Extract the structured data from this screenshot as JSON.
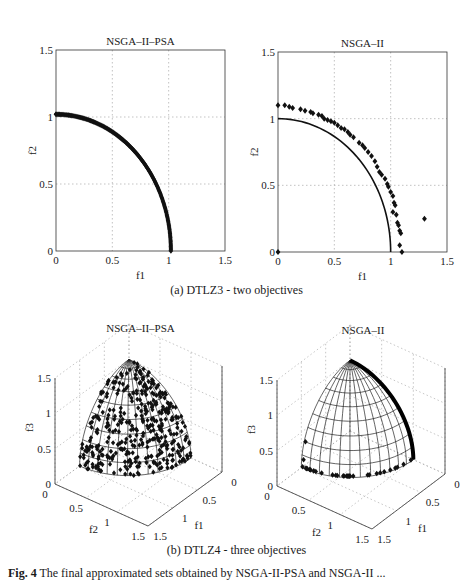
{
  "figure": {
    "subcaption_a": "(a) DTLZ3 - two objectives",
    "subcaption_b": "(b) DTLZ4 - three objectives",
    "caption_bold": "Fig. 4",
    "caption_text": " The final approximated sets obtained by NSGA-II-PSA and NSGA-II ..."
  },
  "chart_data": [
    {
      "id": "a1",
      "type": "scatter",
      "title": "NSGA–II–PSA",
      "xlabel": "f1",
      "ylabel": "f2",
      "xlim": [
        0,
        1.5
      ],
      "ylim": [
        0,
        1.5
      ],
      "xticks": [
        "0",
        "0.5",
        "1",
        "1.5"
      ],
      "yticks": [
        "0",
        "0.5",
        "1",
        "1.5"
      ],
      "grid": true,
      "box": {
        "left": 56,
        "top": 50,
        "right": 225,
        "bottom": 251
      },
      "reference_front": "none",
      "series": [
        {
          "name": "NSGA-II-PSA",
          "description": "dense points along quarter circle radius ~1.02, f1 in [0,1.02]",
          "radius": 1.02,
          "count": 160
        }
      ]
    },
    {
      "id": "a2",
      "type": "scatter",
      "title": "NSGA–II",
      "xlabel": "f1",
      "ylabel": "f2",
      "xlim": [
        0,
        1.5
      ],
      "ylim": [
        0,
        1.5
      ],
      "xticks": [
        "0",
        "0.5",
        "1",
        "1.5"
      ],
      "yticks": [
        "0",
        "0.5",
        "1",
        "1.5"
      ],
      "grid": true,
      "box": {
        "left": 278,
        "top": 52,
        "right": 447,
        "bottom": 252
      },
      "reference_front": "quarter circle radius 1",
      "series": [
        {
          "name": "NSGA-II",
          "points": [
            [
              0.0,
              1.1
            ],
            [
              0.06,
              1.1
            ],
            [
              0.1,
              1.09
            ],
            [
              0.13,
              1.08
            ],
            [
              0.2,
              1.07
            ],
            [
              0.24,
              1.06
            ],
            [
              0.29,
              1.05
            ],
            [
              0.31,
              1.04
            ],
            [
              0.36,
              1.03
            ],
            [
              0.39,
              1.02
            ],
            [
              0.41,
              1.0
            ],
            [
              0.44,
              0.99
            ],
            [
              0.47,
              0.98
            ],
            [
              0.5,
              0.97
            ],
            [
              0.53,
              0.95
            ],
            [
              0.56,
              0.93
            ],
            [
              0.59,
              0.92
            ],
            [
              0.62,
              0.9
            ],
            [
              0.64,
              0.88
            ],
            [
              0.67,
              0.86
            ],
            [
              0.72,
              0.82
            ],
            [
              0.75,
              0.8
            ],
            [
              0.77,
              0.78
            ],
            [
              0.8,
              0.75
            ],
            [
              0.83,
              0.72
            ],
            [
              0.86,
              0.68
            ],
            [
              0.88,
              0.64
            ],
            [
              0.9,
              0.6
            ],
            [
              0.92,
              0.58
            ],
            [
              0.95,
              0.55
            ],
            [
              0.97,
              0.51
            ],
            [
              0.98,
              0.49
            ],
            [
              1.0,
              0.45
            ],
            [
              1.02,
              0.42
            ],
            [
              1.03,
              0.37
            ],
            [
              1.04,
              0.35
            ],
            [
              1.02,
              0.3
            ],
            [
              1.05,
              0.28
            ],
            [
              1.06,
              0.22
            ],
            [
              1.07,
              0.2
            ],
            [
              1.08,
              0.16
            ],
            [
              1.09,
              0.14
            ],
            [
              1.08,
              0.05
            ],
            [
              1.1,
              0.0
            ],
            [
              0.0,
              0.0
            ],
            [
              1.3,
              0.25
            ]
          ]
        }
      ]
    },
    {
      "id": "b1",
      "type": "scatter3d",
      "title": "NSGA–II–PSA",
      "xlabel": "f1",
      "ylabel": "f2",
      "zlabel": "f3",
      "xlim": [
        0,
        1.5
      ],
      "ylim": [
        0,
        1.5
      ],
      "zlim": [
        0,
        1.5
      ],
      "xticks": [
        "0",
        "0.5",
        "1",
        "1.5"
      ],
      "yticks": [
        "0",
        "0.5",
        "1",
        "1.5"
      ],
      "zticks": [
        "0",
        "0.5",
        "1",
        "1.5"
      ],
      "frame": {
        "origin": [
          55,
          484
        ],
        "f2_end": [
          148,
          526
        ],
        "f1_end": [
          222,
          472
        ],
        "z_top": 378
      },
      "reference_front": "unit sphere octant (mesh)",
      "series": [
        {
          "name": "NSGA-II-PSA",
          "description": "~400 points spread over the spherical front",
          "count": 380
        }
      ]
    },
    {
      "id": "b2",
      "type": "scatter3d",
      "title": "NSGA–II",
      "xlabel": "f1",
      "ylabel": "f2",
      "zlabel": "f3",
      "xlim": [
        0,
        1.5
      ],
      "ylim": [
        0,
        1.5
      ],
      "zlim": [
        0,
        1.5
      ],
      "xticks": [
        "0",
        "0.5",
        "1",
        "1.5"
      ],
      "yticks": [
        "0",
        "0.5",
        "1",
        "1.5"
      ],
      "zticks": [
        "0",
        "0.5",
        "1",
        "1.5"
      ],
      "frame": {
        "origin": [
          277,
          486
        ],
        "f2_end": [
          372,
          529
        ],
        "f1_end": [
          445,
          474
        ],
        "z_top": 380
      },
      "reference_front": "unit sphere octant (mesh)",
      "series": [
        {
          "name": "NSGA-II",
          "description": "points concentrated on f1=0 boundary arc and f3=0 base arc, few on f2=0 edge"
        }
      ]
    }
  ]
}
